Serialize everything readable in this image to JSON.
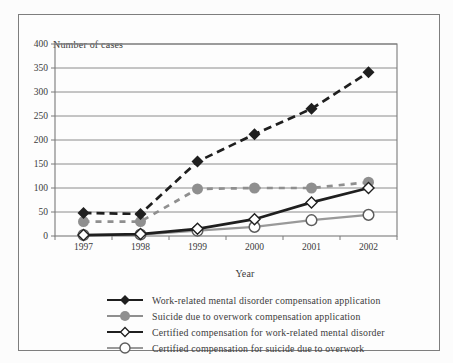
{
  "chart_data": {
    "type": "line",
    "xlabel": "Year",
    "ylabel": "Number of cases",
    "categories": [
      "1997",
      "1998",
      "1999",
      "2000",
      "2001",
      "2002"
    ],
    "ylim": [
      0,
      400
    ],
    "ytick_step": 50,
    "ytick_labels": [
      "0",
      "50",
      "100",
      "150",
      "200",
      "250",
      "300",
      "350",
      "400"
    ],
    "grid": true,
    "legend_position": "bottom",
    "series": [
      {
        "name": "Work-related mental disorder compensation application",
        "marker": "diamond-filled",
        "line": "dashed",
        "color": "#1f1f1f",
        "values": [
          48,
          46,
          155,
          212,
          265,
          341
        ]
      },
      {
        "name": "Suicide due to overwork compensation application",
        "marker": "circle-filled",
        "line": "dashed",
        "color": "#8f8f8f",
        "values": [
          30,
          30,
          98,
          100,
          100,
          112
        ]
      },
      {
        "name": "Certified compensation for work-related mental disorder",
        "marker": "diamond-open",
        "line": "solid",
        "color": "#1f1f1f",
        "values": [
          2,
          4,
          15,
          35,
          70,
          100
        ]
      },
      {
        "name": "Certified compensation for suicide due to overwork",
        "marker": "circle-open",
        "line": "solid",
        "color": "#999999",
        "values": [
          2,
          3,
          11,
          19,
          33,
          44
        ]
      }
    ],
    "draw_order": [
      1,
      0,
      3,
      2
    ]
  }
}
